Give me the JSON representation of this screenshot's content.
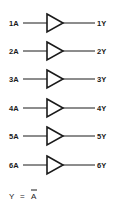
{
  "diagram": {
    "type": "logic-diagram",
    "gates": [
      {
        "input": "1A",
        "output": "1Y",
        "symbol": "buffer-triangle"
      },
      {
        "input": "2A",
        "output": "2Y",
        "symbol": "buffer-triangle"
      },
      {
        "input": "3A",
        "output": "3Y",
        "symbol": "buffer-triangle"
      },
      {
        "input": "4A",
        "output": "4Y",
        "symbol": "buffer-triangle"
      },
      {
        "input": "5A",
        "output": "5Y",
        "symbol": "buffer-triangle"
      },
      {
        "input": "6A",
        "output": "6Y",
        "symbol": "buffer-triangle"
      }
    ],
    "equation": {
      "lhs": "Y",
      "op": "=",
      "rhs": "A",
      "rhs_overbar": true
    },
    "colors": {
      "ink": "#1a1a1a",
      "background": "#ffffff"
    }
  }
}
